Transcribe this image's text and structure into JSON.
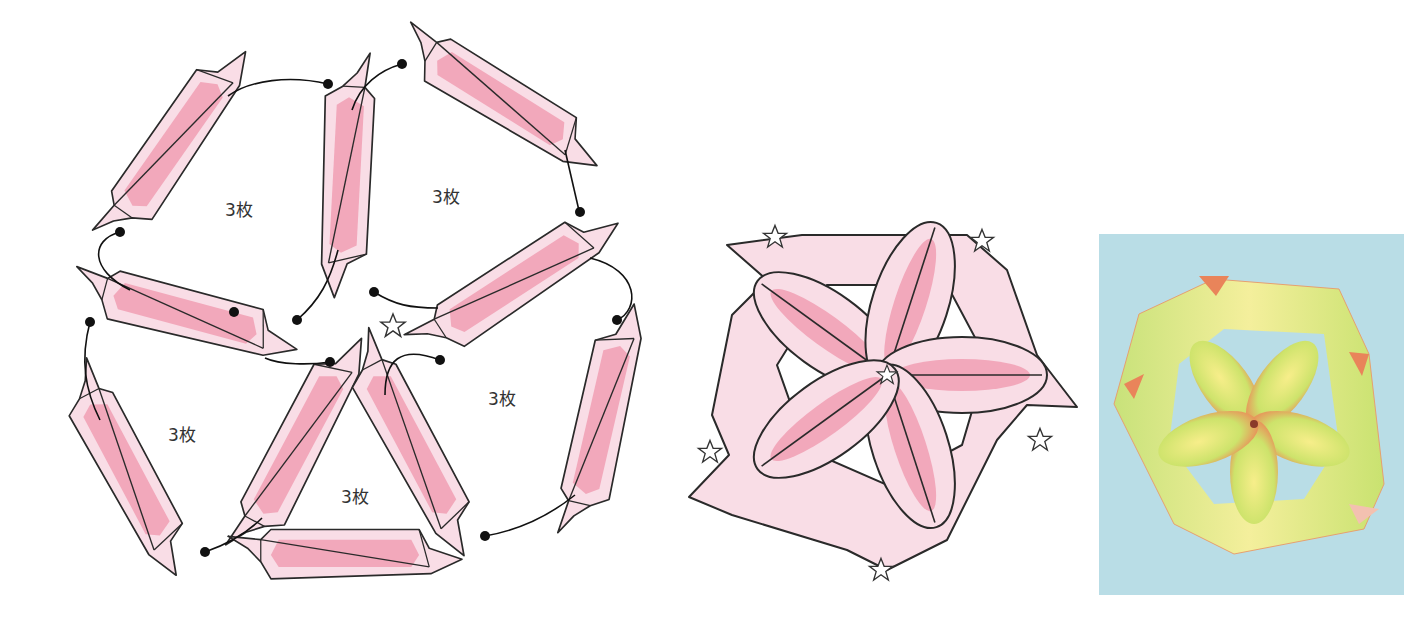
{
  "figure": {
    "type": "origami-assembly-diagram",
    "palette": {
      "unit_fill": "#f9dde6",
      "unit_core": "#f2a8bb",
      "outline": "#2a2a2a",
      "photo_background": "#b9dde6"
    }
  },
  "assembly_diagram": {
    "groups": [
      {
        "label": "3枚",
        "position": "top-left"
      },
      {
        "label": "3枚",
        "position": "top-right"
      },
      {
        "label": "3枚",
        "position": "bottom-left"
      },
      {
        "label": "3枚",
        "position": "bottom-right"
      },
      {
        "label": "3枚",
        "position": "center-triangle"
      }
    ],
    "center_marker": "☆",
    "unit_count": 10
  },
  "finished_diagram": {
    "star_markers": [
      "☆",
      "☆",
      "☆",
      "☆",
      "☆",
      "☆"
    ],
    "petals": 5
  },
  "photo": {
    "description": "Finished origami flower kusudama unit, yellow-green paper with orange dots, on light blue background"
  }
}
